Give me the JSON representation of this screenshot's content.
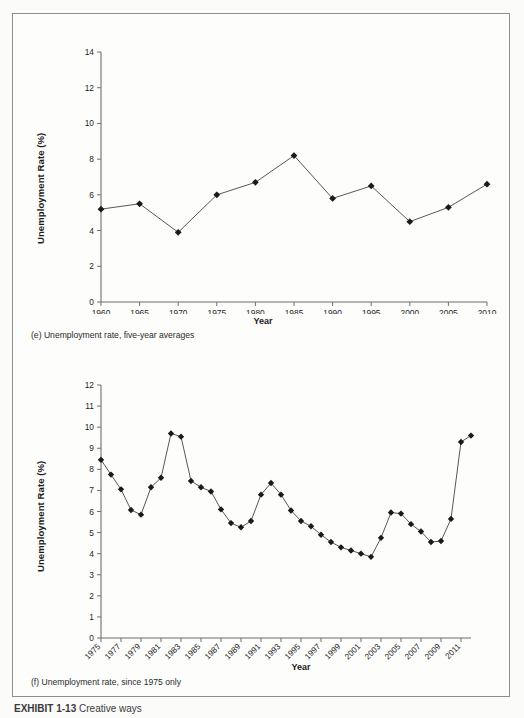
{
  "figure": {
    "bottom_caption_bold": "EXHIBIT 1-13",
    "bottom_caption_rest": "Creative ways"
  },
  "panels": [
    {
      "id": "panel-e",
      "caption": "(e) Unemployment rate, five-year averages",
      "ylabel": "Unemployment Rate (%)",
      "xlabel": "Year"
    },
    {
      "id": "panel-f",
      "caption": "(f) Unemployment rate, since 1975 only",
      "ylabel": "Unemployment Rate (%)",
      "xlabel": "Year"
    }
  ],
  "chart_data": [
    {
      "type": "line",
      "title": "(e) Unemployment rate, five-year averages",
      "xlabel": "Year",
      "ylabel": "Unemployment Rate (%)",
      "xlim": [
        1960,
        2010
      ],
      "ylim": [
        0,
        14
      ],
      "ytick_labels": [
        "0",
        "2",
        "4",
        "6",
        "8",
        "10",
        "12",
        "14"
      ],
      "yticks": [
        0,
        2,
        4,
        6,
        8,
        10,
        12,
        14
      ],
      "xtick_labels": [
        "1960",
        "1965",
        "1970",
        "1975",
        "1980",
        "1985",
        "1990",
        "1995",
        "2000",
        "2005",
        "2010"
      ],
      "xticks": [
        1960,
        1965,
        1970,
        1975,
        1980,
        1985,
        1990,
        1995,
        2000,
        2005,
        2010
      ],
      "grid": false,
      "legend": false,
      "marker": "diamond",
      "x": [
        1960,
        1965,
        1970,
        1975,
        1980,
        1985,
        1990,
        1995,
        2000,
        2005,
        2010
      ],
      "values": [
        5.2,
        5.5,
        3.9,
        6.0,
        6.7,
        8.2,
        5.8,
        6.5,
        4.5,
        5.3,
        6.6
      ]
    },
    {
      "type": "line",
      "title": "(f) Unemployment rate, since 1975 only",
      "xlabel": "Year",
      "ylabel": "Unemployment Rate (%)",
      "xlim": [
        1975,
        2012
      ],
      "ylim": [
        0,
        12
      ],
      "ytick_labels": [
        "0",
        "1",
        "2",
        "3",
        "4",
        "5",
        "6",
        "7",
        "8",
        "9",
        "10",
        "11",
        "12"
      ],
      "yticks": [
        0,
        1,
        2,
        3,
        4,
        5,
        6,
        7,
        8,
        9,
        10,
        11,
        12
      ],
      "xtick_labels": [
        "1975",
        "1977",
        "1979",
        "1981",
        "1983",
        "1985",
        "1987",
        "1989",
        "1991",
        "1993",
        "1995",
        "1997",
        "1999",
        "2001",
        "2003",
        "2005",
        "2007",
        "2009",
        "2011"
      ],
      "xticks": [
        1975,
        1977,
        1979,
        1981,
        1983,
        1985,
        1987,
        1989,
        1991,
        1993,
        1995,
        1997,
        1999,
        2001,
        2003,
        2005,
        2007,
        2009,
        2011
      ],
      "xtick_rotation": -45,
      "grid": false,
      "legend": false,
      "marker": "diamond",
      "x": [
        1975,
        1976,
        1977,
        1978,
        1979,
        1980,
        1981,
        1982,
        1983,
        1984,
        1985,
        1986,
        1987,
        1988,
        1989,
        1990,
        1991,
        1992,
        1993,
        1994,
        1995,
        1996,
        1997,
        1998,
        1999,
        2000,
        2001,
        2002,
        2003,
        2004,
        2005,
        2006,
        2007,
        2008,
        2009,
        2010,
        2011,
        2012
      ],
      "values": [
        8.45,
        7.75,
        7.05,
        6.07,
        5.85,
        7.15,
        7.6,
        9.7,
        9.55,
        7.45,
        7.15,
        6.95,
        6.1,
        5.45,
        5.25,
        5.55,
        6.8,
        7.35,
        6.8,
        6.05,
        5.55,
        5.3,
        4.9,
        4.55,
        4.3,
        4.15,
        4.0,
        3.85,
        4.75,
        5.95,
        5.9,
        5.4,
        5.05,
        4.55,
        4.6,
        5.65,
        9.3,
        9.6,
        8.9,
        8.0
      ]
    }
  ]
}
